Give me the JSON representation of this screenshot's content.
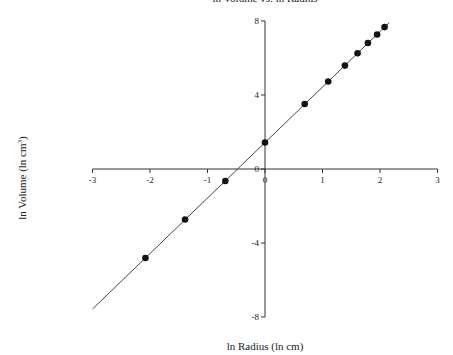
{
  "chart_data": {
    "type": "scatter",
    "title": "ln Volume vs. ln Radius",
    "xlabel": "ln Radius (ln cm)",
    "ylabel": "ln Volume (ln cm³)",
    "xlim": [
      -3,
      3
    ],
    "ylim": [
      -8,
      8
    ],
    "x_ticks": [
      -3,
      -2,
      -1,
      0,
      1,
      2,
      3
    ],
    "y_ticks": [
      -8,
      -4,
      0,
      4,
      8
    ],
    "grid": false,
    "legend": null,
    "series": [
      {
        "name": "data points",
        "marker": "filled-circle",
        "x": [
          -2.08,
          -1.39,
          -0.69,
          0.0,
          0.69,
          1.1,
          1.39,
          1.61,
          1.79,
          1.95,
          2.08
        ],
        "y": [
          -4.81,
          -2.73,
          -0.65,
          1.43,
          3.51,
          4.73,
          5.59,
          6.26,
          6.81,
          7.27,
          7.67
        ]
      }
    ],
    "fit_line": {
      "name": "linear fit",
      "slope": 3.0,
      "intercept": 1.43,
      "x_range": [
        -3.0,
        2.16
      ]
    }
  },
  "labels": {
    "title": "ln Volume vs. ln Radius",
    "xlabel": "ln Radius (ln cm)",
    "ylabel_main": "ln Volume (ln cm",
    "ylabel_sup": "3",
    "ylabel_end": ")"
  },
  "colors": {
    "axis": "#333333",
    "line": "#444444",
    "marker": "#111111"
  }
}
